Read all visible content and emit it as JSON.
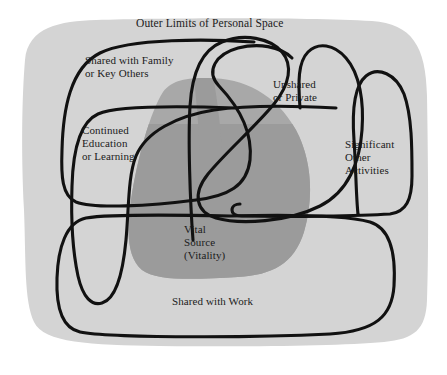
{
  "diagram": {
    "title": "Outer Limits of Personal Space",
    "type": "venn-overlapping-regions",
    "background_color": "#ffffff",
    "outer_field": {
      "name": "Outer Limits of Personal Space",
      "label": "Outer Limits of Personal Space",
      "fill_color": "#d4d4d4"
    },
    "core_blob": {
      "name": "Vital Source (Vitality)",
      "label_lines": [
        "Vital",
        "Source",
        "(Vitality)"
      ],
      "label": "Vital\nSource\n(Vitality)",
      "fill_color": "#a8a8a8",
      "overlap_fill_color": "#9a9a9a"
    },
    "regions": [
      {
        "id": "shared-with-family",
        "label": "Shared with Family\nor Key Others",
        "label_lines": [
          "Shared with Family",
          "or Key Others"
        ],
        "stroke_color": "#111111"
      },
      {
        "id": "continued-education",
        "label": "Continued\nEducation\nor Learning",
        "label_lines": [
          "Continued",
          "Education",
          "or Learning"
        ],
        "stroke_color": "#111111"
      },
      {
        "id": "unshared-or-private",
        "label": "Unshared\nor Private",
        "label_lines": [
          "Unshared",
          "or Private"
        ],
        "stroke_color": "#111111"
      },
      {
        "id": "significant-other-activities",
        "label": "Significant\nOther\nActivities",
        "label_lines": [
          "Significant",
          "Other",
          "Activities"
        ],
        "stroke_color": "#111111"
      },
      {
        "id": "shared-with-work",
        "label": "Shared with Work",
        "label_lines": [
          "Shared with Work"
        ],
        "stroke_color": "#111111"
      }
    ]
  }
}
